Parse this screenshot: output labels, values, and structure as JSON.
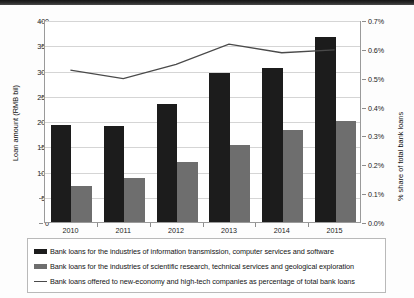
{
  "chart_data": {
    "type": "bar",
    "title": "",
    "subtitle": "",
    "xlabel": "",
    "ylabel": "Loan amount (RMB bil)",
    "y2label": "% share of total bank loans",
    "categories": [
      "2010",
      "2011",
      "2012",
      "2013",
      "2014",
      "2015"
    ],
    "ylim": [
      0,
      400
    ],
    "yticks": [
      "0",
      "50",
      "100",
      "150",
      "200",
      "250",
      "300",
      "350",
      "400"
    ],
    "ytick_values": [
      0,
      50,
      100,
      150,
      200,
      250,
      300,
      350,
      400
    ],
    "y2lim": [
      0,
      0.7
    ],
    "y2ticks": [
      "0.0%",
      "0.1%",
      "0.2%",
      "0.3%",
      "0.4%",
      "0.5%",
      "0.6%",
      "0.7%"
    ],
    "y2tick_values": [
      0,
      0.1,
      0.2,
      0.3,
      0.4,
      0.5,
      0.6,
      0.7
    ],
    "grid": true,
    "legend_position": "bottom",
    "series": [
      {
        "name": "Bank loans for the industries of information transmission, computer services and software",
        "type": "bar",
        "axis": "left",
        "color": "#1c1c1c",
        "values": [
          192,
          190,
          234,
          295,
          305,
          367
        ]
      },
      {
        "name": "Bank loans for the industries of scientific research, technical services and geological exploration",
        "type": "bar",
        "axis": "left",
        "color": "#6e6e6e",
        "values": [
          72,
          88,
          119,
          153,
          182,
          201
        ]
      },
      {
        "name": "Bank loans offered to new-economy and high-tech companies as percentage of total bank loans",
        "type": "line",
        "axis": "right",
        "color": "#4a4a4a",
        "values": [
          0.53,
          0.5,
          0.55,
          0.62,
          0.59,
          0.6
        ]
      }
    ]
  },
  "legend": {
    "items": [
      {
        "marker": "black-square-swatch",
        "label": "Bank loans for the industries of information transmission, computer services and software"
      },
      {
        "marker": "gray-square-swatch",
        "label": "Bank loans for the industries of scientific research, technical services and geological exploration"
      },
      {
        "marker": "line-swatch",
        "label": "Bank loans offered to new-economy and high-tech companies as percentage of total bank loans"
      }
    ]
  },
  "colors": {
    "series1": "#1c1c1c",
    "series2": "#6e6e6e",
    "series3": "#4a4a4a",
    "grid": "#d5d5d5",
    "axis": "#9a9a9a",
    "background": "#ffffff"
  }
}
